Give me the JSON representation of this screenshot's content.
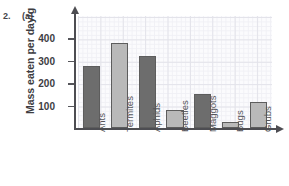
{
  "page": {
    "top_cut_text": "",
    "question_number": "2.",
    "question_part": "(a)"
  },
  "chart_data": {
    "type": "bar",
    "title": "",
    "xlabel": "",
    "ylabel": "Mass eaten per day/g",
    "categories": [
      "Ants",
      "Termites",
      "Aphids",
      "Beetles",
      "Maggots",
      "Bugs",
      "Grubs"
    ],
    "values": [
      275,
      380,
      322,
      80,
      152,
      25,
      115
    ],
    "ylim": [
      0,
      500
    ],
    "yticks": [
      100,
      200,
      300,
      400
    ],
    "ytick_labels": [
      "100",
      "200",
      "300",
      "400"
    ],
    "grid": true,
    "legend": "none",
    "bar_colors": [
      "#6d6d6d",
      "#b9b9b9",
      "#6d6d6d",
      "#b9b9b9",
      "#6d6d6d",
      "#b9b9b9",
      "#b9b9b9"
    ],
    "axis_color": "#4d4d52",
    "grid_color": "#e3e3ea",
    "bar_border_color": "#5d5d5d"
  }
}
